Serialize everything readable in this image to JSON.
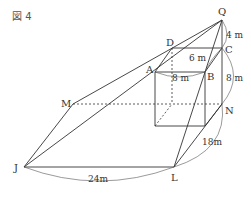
{
  "figure": {
    "title": "図 4",
    "points": {
      "Q": "Q",
      "C": "C",
      "D": "D",
      "A": "A",
      "B": "B",
      "N": "N",
      "M": "M",
      "J": "J",
      "L": "L"
    },
    "measurements": {
      "QC": "4 m",
      "DC": "6 m",
      "AB": "8 m",
      "CN": "8 m",
      "NL": "18m",
      "JL": "24m"
    },
    "colors": {
      "line": "#333333",
      "label": "#333333"
    }
  }
}
